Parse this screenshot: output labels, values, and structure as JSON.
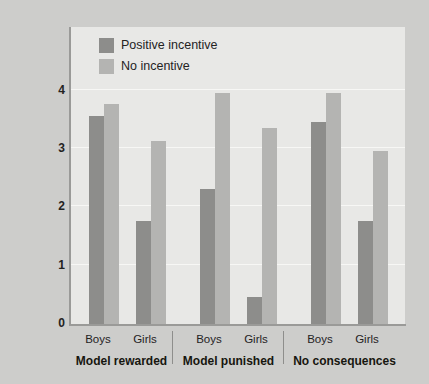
{
  "chart_data": {
    "type": "bar",
    "title": "",
    "subtitle": "",
    "xlabel": "",
    "ylabel": "Mean number of different imitative responses reproduced",
    "ylim": [
      0,
      4.6
    ],
    "yticks": [
      0,
      1,
      2,
      3,
      4
    ],
    "ytick_labels": [
      "0",
      "1",
      "2",
      "3",
      "4"
    ],
    "grid": true,
    "grid_axis": "y",
    "legend_position": "top-left",
    "categories": [
      "Boys",
      "Girls",
      "Boys",
      "Girls",
      "Boys",
      "Girls"
    ],
    "groups": [
      {
        "group_label": "Model rewarded",
        "bars": [
          {
            "category": "Boys",
            "series": "Positive incentive",
            "value": 3.6
          },
          {
            "category": "Boys",
            "series": "No incentive",
            "value": 3.8
          },
          {
            "category": "Girls",
            "series": "Positive incentive",
            "value": 1.8
          },
          {
            "category": "Girls",
            "series": "No incentive",
            "value": 3.17
          }
        ]
      },
      {
        "group_label": "Model punished",
        "bars": [
          {
            "category": "Boys",
            "series": "Positive incentive",
            "value": 2.35
          },
          {
            "category": "Boys",
            "series": "No incentive",
            "value": 4.0
          },
          {
            "category": "Girls",
            "series": "Positive incentive",
            "value": 0.5
          },
          {
            "category": "Girls",
            "series": "No incentive",
            "value": 3.4
          }
        ]
      },
      {
        "group_label": "No consequences",
        "bars": [
          {
            "category": "Boys",
            "series": "Positive incentive",
            "value": 3.5
          },
          {
            "category": "Boys",
            "series": "No incentive",
            "value": 4.0
          },
          {
            "category": "Girls",
            "series": "Positive incentive",
            "value": 1.8
          },
          {
            "category": "Girls",
            "series": "No incentive",
            "value": 3.0
          }
        ]
      }
    ],
    "series": [
      {
        "name": "Positive incentive",
        "color": "#8d8d8b",
        "values": [
          3.6,
          1.8,
          2.35,
          0.5,
          3.5,
          1.8
        ]
      },
      {
        "name": "No incentive",
        "color": "#b4b4b2",
        "values": [
          3.8,
          3.17,
          4.0,
          3.4,
          4.0,
          3.0
        ]
      }
    ]
  },
  "legend": {
    "items": [
      {
        "label": "Positive incentive",
        "swatch": "dark"
      },
      {
        "label": "No incentive",
        "swatch": "light"
      }
    ]
  },
  "axis": {
    "y_label": "Mean number of different imitative responses reproduced",
    "y_ticks": [
      "4",
      "3",
      "2",
      "1",
      "0"
    ]
  },
  "x_axis": {
    "sub_labels": [
      "Boys",
      "Girls",
      "Boys",
      "Girls",
      "Boys",
      "Girls"
    ],
    "group_labels": [
      "Model rewarded",
      "Model punished",
      "No consequences"
    ]
  },
  "colors": {
    "page_background": "#cdcdcb",
    "plot_background": "#e8e8e6",
    "series_positive_incentive": "#8d8d8b",
    "series_no_incentive": "#b4b4b2",
    "axis_line": "#9a9a98",
    "gridline": "#f7f7f5",
    "text": "#24231f"
  }
}
